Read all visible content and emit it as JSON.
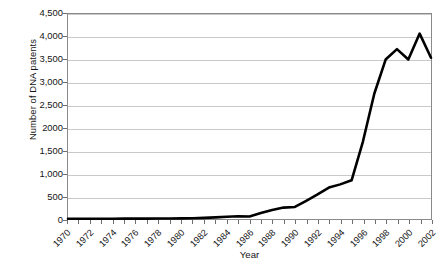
{
  "chart_data": {
    "type": "line",
    "title": "",
    "xlabel": "Year",
    "ylabel": "Number of DNA patents",
    "grid": "horizontal",
    "legend_position": "none",
    "line_color": "#000000",
    "gridline_color": "#c9c9c9",
    "frame_color": "#8a8a8a",
    "xlim": [
      1970,
      2002
    ],
    "ylim": [
      0,
      4500
    ],
    "y_ticks": [
      0,
      500,
      1000,
      1500,
      2000,
      2500,
      3000,
      3500,
      4000,
      4500
    ],
    "y_tick_labels": [
      "0",
      "500",
      "1,000",
      "1,500",
      "2000",
      "2,500",
      "3,000",
      "3,500",
      "4,000",
      "4,500"
    ],
    "x_ticks": [
      1970,
      1972,
      1974,
      1976,
      1978,
      1980,
      1982,
      1984,
      1986,
      1988,
      1990,
      1992,
      1994,
      1996,
      1998,
      2000,
      2002
    ],
    "x_tick_labels": [
      "1970",
      "1972",
      "1974",
      "1976",
      "1978",
      "1980",
      "1982",
      "1984",
      "1986",
      "1988",
      "1990",
      "1992",
      "1994",
      "1996",
      "1998",
      "2000",
      "2002"
    ],
    "x": [
      1970,
      1971,
      1972,
      1973,
      1974,
      1975,
      1976,
      1977,
      1978,
      1979,
      1980,
      1981,
      1982,
      1983,
      1984,
      1985,
      1986,
      1987,
      1988,
      1989,
      1990,
      1991,
      1992,
      1993,
      1994,
      1995,
      1996,
      1997,
      1998,
      1999,
      2000,
      2001,
      2002
    ],
    "values": [
      5,
      5,
      6,
      6,
      7,
      8,
      8,
      9,
      10,
      12,
      14,
      18,
      25,
      35,
      50,
      60,
      55,
      130,
      200,
      250,
      265,
      400,
      540,
      690,
      760,
      850,
      1700,
      2750,
      3500,
      3730,
      3500,
      4070,
      3540
    ],
    "series": [
      {
        "name": "Number of DNA patents",
        "values": [
          5,
          5,
          6,
          6,
          7,
          8,
          8,
          9,
          10,
          12,
          14,
          18,
          25,
          35,
          50,
          60,
          55,
          130,
          200,
          250,
          265,
          400,
          540,
          690,
          760,
          850,
          1700,
          2750,
          3500,
          3730,
          3500,
          4070,
          3540
        ]
      }
    ],
    "annotations": []
  }
}
